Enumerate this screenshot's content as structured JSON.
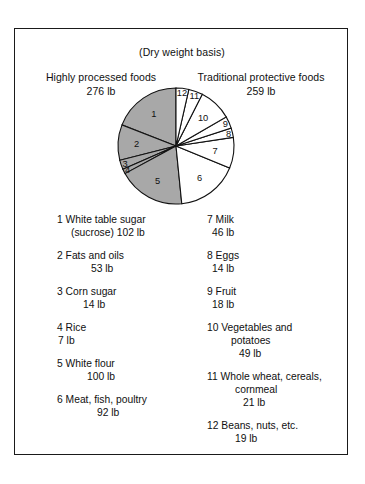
{
  "figure": {
    "subtitle": "(Dry weight basis)",
    "groups": [
      {
        "name": "Highly processed foods",
        "value": "276 lb",
        "shaded": true
      },
      {
        "name": "Traditional protective foods",
        "value": "259 lb",
        "shaded": false
      }
    ]
  },
  "chart_data": {
    "type": "pie",
    "title": "",
    "subtitle": "(Dry weight basis)",
    "unit": "lb",
    "total": 535,
    "start_angle_deg": 0,
    "direction": "counterclockwise",
    "legend_position": "below",
    "groups": [
      {
        "name": "Highly processed foods",
        "total": 276,
        "fill": "#a8a8a8",
        "slices": [
          1,
          2,
          3,
          4,
          5
        ]
      },
      {
        "name": "Traditional protective foods",
        "total": 259,
        "fill": "#ffffff",
        "slices": [
          6,
          7,
          8,
          9,
          10,
          11,
          12
        ]
      }
    ],
    "categories": [
      "White table sugar (sucrose)",
      "Fats and oils",
      "Corn sugar",
      "Rice",
      "White flour",
      "Meat, fish, poultry",
      "Milk",
      "Eggs",
      "Fruit",
      "Vegetables and potatoes",
      "Whole wheat, cereals, cornmeal",
      "Beans, nuts, etc."
    ],
    "values": [
      102,
      53,
      14,
      7,
      100,
      92,
      46,
      14,
      18,
      49,
      21,
      19
    ],
    "slice_numbers": [
      1,
      2,
      3,
      4,
      5,
      6,
      7,
      8,
      9,
      10,
      11,
      12
    ]
  },
  "legend": {
    "left_column": [
      {
        "number": "1",
        "name": "White table sugar",
        "line2": "(sucrose) 102 lb",
        "value": "102 lb"
      },
      {
        "number": "2",
        "name": "Fats and oils",
        "line2": "53 lb",
        "value": "53 lb"
      },
      {
        "number": "3",
        "name": "Corn sugar",
        "line2": "14 lb",
        "value": "14 lb"
      },
      {
        "number": "4",
        "name": "Rice",
        "line2": "7 lb",
        "value": "7 lb"
      },
      {
        "number": "5",
        "name": "White flour",
        "line2": "100 lb",
        "value": "100 lb"
      },
      {
        "number": "6",
        "name": "Meat, fish, poultry",
        "line2": "92 lb",
        "value": "92 lb"
      }
    ],
    "right_column": [
      {
        "number": "7",
        "name": "Milk",
        "line2": "46 lb",
        "value": "46 lb"
      },
      {
        "number": "8",
        "name": "Eggs",
        "line2": "14 lb",
        "value": "14 lb"
      },
      {
        "number": "9",
        "name": "Fruit",
        "line2": "18 lb",
        "value": "18 lb"
      },
      {
        "number": "10",
        "name": "Vegetables and",
        "line2": "potatoes",
        "line3": "49 lb",
        "value": "49 lb"
      },
      {
        "number": "11",
        "name": "Whole wheat, cereals,",
        "line2": "cornmeal",
        "line3": "21 lb",
        "value": "21 lb"
      },
      {
        "number": "12",
        "name": "Beans, nuts, etc.",
        "line2": "19 lb",
        "value": "19 lb"
      }
    ],
    "entries_text": {
      "e1_l1": "1 White table sugar",
      "e1_l2": "(sucrose) 102 lb",
      "e2_l1": "2 Fats and oils",
      "e2_l2": "53 lb",
      "e3_l1": "3 Corn sugar",
      "e3_l2": "14 lb",
      "e4_l1": "4 Rice",
      "e4_l2": "7 lb",
      "e5_l1": "5 White flour",
      "e5_l2": "100 lb",
      "e6_l1": "6 Meat, fish, poultry",
      "e6_l2": "92 lb",
      "e7_l1": "7 Milk",
      "e7_l2": "46 lb",
      "e8_l1": "8 Eggs",
      "e8_l2": "14 lb",
      "e9_l1": "9 Fruit",
      "e9_l2": "18 lb",
      "e10_l1": "10 Vegetables and",
      "e10_l2": "potatoes",
      "e10_l3": "49 lb",
      "e11_l1": "11 Whole wheat, cereals,",
      "e11_l2": "cornmeal",
      "e11_l3": "21 lb",
      "e12_l1": "12 Beans, nuts, etc.",
      "e12_l2": "19 lb"
    }
  },
  "colors": {
    "shaded_slice": "#a8a8a8",
    "unshaded_slice": "#ffffff",
    "outline": "#111111",
    "frame": "#1a1a1a"
  }
}
